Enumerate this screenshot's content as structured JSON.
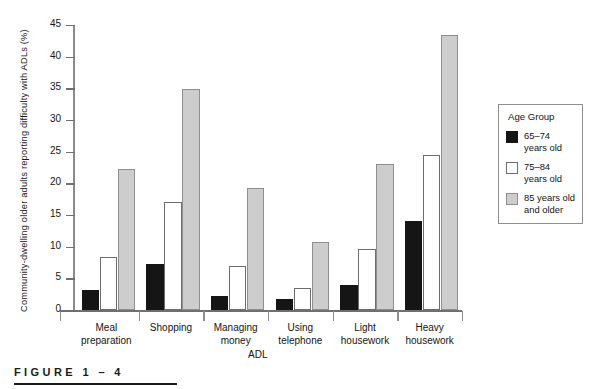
{
  "figure": {
    "caption": "FIGURE  1 – 4"
  },
  "chart_data": {
    "type": "bar",
    "title": "",
    "xlabel": "ADL",
    "ylabel": "Community-dwelling older adults reporting difficulty with ADLs (%)",
    "ylim": [
      0,
      45
    ],
    "yticks": [
      0,
      5,
      10,
      15,
      20,
      25,
      30,
      35,
      40,
      45
    ],
    "grid": false,
    "legend_position": "right",
    "legend_title": "Age Group",
    "categories": [
      "Meal preparation",
      "Shopping",
      "Managing money",
      "Using telephone",
      "Light housework",
      "Heavy housework"
    ],
    "category_lines": [
      [
        "Meal",
        "preparation"
      ],
      [
        "Shopping"
      ],
      [
        "Managing",
        "money"
      ],
      [
        "Using",
        "telephone"
      ],
      [
        "Light",
        "housework"
      ],
      [
        "Heavy",
        "housework"
      ]
    ],
    "series": [
      {
        "name": "65–74 years old",
        "label_lines": [
          "65–74",
          "years old"
        ],
        "color": "#151515",
        "values": [
          3.1,
          7.3,
          2.2,
          1.7,
          4.0,
          14.0
        ]
      },
      {
        "name": "75–84 years old",
        "label_lines": [
          "75–84",
          "years old"
        ],
        "color": "#ffffff",
        "values": [
          8.4,
          17.0,
          7.0,
          3.4,
          9.6,
          24.5
        ]
      },
      {
        "name": "85 years old and older",
        "label_lines": [
          "85 years old",
          "and older"
        ],
        "color": "#cdcdcd",
        "values": [
          22.3,
          34.9,
          19.2,
          10.7,
          23.0,
          43.4
        ]
      }
    ]
  }
}
